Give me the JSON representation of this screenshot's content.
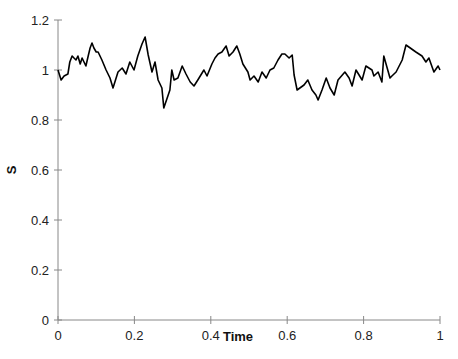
{
  "chart_data": {
    "type": "line",
    "title": "",
    "xlabel": "Time",
    "ylabel": "S",
    "xlim": [
      0,
      1
    ],
    "ylim": [
      0,
      1.2
    ],
    "x_ticks": [
      "0",
      "0.2",
      "0.4",
      "0.6",
      "0.8",
      "1"
    ],
    "y_ticks": [
      "0",
      "0.2",
      "0.4",
      "0.6",
      "0.8",
      "1",
      "1.2"
    ],
    "grid": false,
    "legend": null,
    "series": [
      {
        "name": "S",
        "color": "#000000",
        "x": [
          0.0,
          0.008,
          0.016,
          0.026,
          0.031,
          0.037,
          0.042,
          0.047,
          0.052,
          0.058,
          0.063,
          0.068,
          0.073,
          0.079,
          0.084,
          0.089,
          0.094,
          0.1,
          0.105,
          0.115,
          0.126,
          0.136,
          0.144,
          0.157,
          0.168,
          0.178,
          0.188,
          0.199,
          0.209,
          0.22,
          0.228,
          0.236,
          0.246,
          0.254,
          0.254,
          0.262,
          0.272,
          0.277,
          0.293,
          0.298,
          0.304,
          0.314,
          0.325,
          0.335,
          0.346,
          0.356,
          0.366,
          0.382,
          0.39,
          0.403,
          0.411,
          0.419,
          0.429,
          0.44,
          0.448,
          0.458,
          0.468,
          0.476,
          0.484,
          0.497,
          0.503,
          0.513,
          0.524,
          0.534,
          0.545,
          0.555,
          0.565,
          0.576,
          0.586,
          0.594,
          0.605,
          0.613,
          0.618,
          0.626,
          0.644,
          0.654,
          0.665,
          0.675,
          0.681,
          0.691,
          0.702,
          0.712,
          0.723,
          0.733,
          0.751,
          0.762,
          0.77,
          0.78,
          0.796,
          0.796,
          0.806,
          0.822,
          0.827,
          0.838,
          0.848,
          0.853,
          0.869,
          0.874,
          0.885,
          0.901,
          0.911,
          0.937,
          0.953,
          0.963,
          0.971,
          0.984,
          0.995,
          1.0
        ],
        "y": [
          1.0,
          0.96,
          0.976,
          0.984,
          1.032,
          1.056,
          1.048,
          1.04,
          1.056,
          1.024,
          1.048,
          1.032,
          1.016,
          1.056,
          1.088,
          1.108,
          1.088,
          1.072,
          1.072,
          1.04,
          1.0,
          0.968,
          0.928,
          0.992,
          1.008,
          0.984,
          1.032,
          1.0,
          1.056,
          1.104,
          1.132,
          1.06,
          0.992,
          1.032,
          1.032,
          0.96,
          0.928,
          0.848,
          0.92,
          1.0,
          0.96,
          0.968,
          1.016,
          0.984,
          0.952,
          0.936,
          0.96,
          1.0,
          0.976,
          1.024,
          1.048,
          1.064,
          1.072,
          1.096,
          1.056,
          1.072,
          1.096,
          1.064,
          1.024,
          0.992,
          0.96,
          0.976,
          0.952,
          0.992,
          0.968,
          1.0,
          1.008,
          1.04,
          1.064,
          1.064,
          1.048,
          1.06,
          0.98,
          0.92,
          0.94,
          0.96,
          0.92,
          0.9,
          0.88,
          0.92,
          0.968,
          0.928,
          0.9,
          0.96,
          0.992,
          0.968,
          0.936,
          1.0,
          0.96,
          0.96,
          1.016,
          1.0,
          0.976,
          0.992,
          0.952,
          1.056,
          0.968,
          0.976,
          0.992,
          1.04,
          1.1,
          1.072,
          1.056,
          1.032,
          1.048,
          0.992,
          1.016,
          1.0
        ]
      }
    ]
  },
  "plot": {
    "x_axis_label": "Time",
    "y_axis_label": "S",
    "line_color": "#000000",
    "axis_color": "#888888"
  }
}
